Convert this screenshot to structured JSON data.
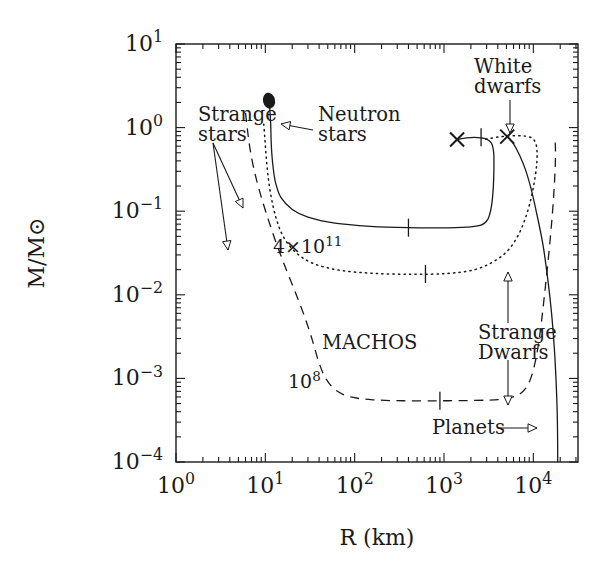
{
  "figure": {
    "type": "scientific-plot",
    "background": "#ffffff",
    "ink": "#1a1a1a"
  },
  "chart_data": {
    "type": "line",
    "title": "",
    "xlabel": "R (km)",
    "ylabel": "M/M⊙",
    "xscale": "log",
    "yscale": "log",
    "xlim": [
      1,
      31623
    ],
    "ylim": [
      0.0001,
      10
    ],
    "grid": false,
    "legend_position": "inline-annotations",
    "x_ticklabels": [
      "10⁰",
      "10¹",
      "10²",
      "10³",
      "10⁴"
    ],
    "x_tick_exponents": [
      0,
      1,
      2,
      3,
      4
    ],
    "y_ticklabels": [
      "10¹",
      "10⁰",
      "10⁻¹",
      "10⁻²",
      "10⁻³",
      "10⁻⁴"
    ],
    "y_tick_exponents": [
      1,
      0,
      -1,
      -2,
      -3,
      -4
    ],
    "series": [
      {
        "name": "neutron-stars-white-dwarfs",
        "style": "solid",
        "description": "Neutron star branch rising to maximum mass then white dwarf / planet sequence",
        "points": [
          [
            11.0,
            2.1
          ],
          [
            11.3,
            1.5
          ],
          [
            11.5,
            1.05
          ],
          [
            11.6,
            0.72
          ],
          [
            11.8,
            0.5
          ],
          [
            12.2,
            0.34
          ],
          [
            13.0,
            0.22
          ],
          [
            15.0,
            0.145
          ],
          [
            20.0,
            0.105
          ],
          [
            30.0,
            0.085
          ],
          [
            60.0,
            0.072
          ],
          [
            150.0,
            0.066
          ],
          [
            400.0,
            0.0635
          ],
          [
            900.0,
            0.0632
          ],
          [
            1800.0,
            0.0645
          ],
          [
            2600.0,
            0.068
          ],
          [
            3100.0,
            0.08
          ],
          [
            3400.0,
            0.115
          ],
          [
            3560.0,
            0.19
          ],
          [
            3620.0,
            0.32
          ],
          [
            3600.0,
            0.5
          ],
          [
            3400.0,
            0.65
          ],
          [
            3000.0,
            0.73
          ],
          [
            2400.0,
            0.76
          ],
          [
            1800.0,
            0.755
          ],
          [
            1400.0,
            0.72
          ]
        ]
      },
      {
        "name": "white-dwarf-outer-sequence",
        "style": "solid",
        "description": "Outer white dwarf branch from maximum-mass cross down to planetary radii",
        "points": [
          [
            5100.0,
            0.78
          ],
          [
            6000.0,
            0.64
          ],
          [
            7000.0,
            0.47
          ],
          [
            8200.0,
            0.31
          ],
          [
            9500.0,
            0.18
          ],
          [
            11000.0,
            0.09
          ],
          [
            12800.0,
            0.04
          ],
          [
            14500.0,
            0.0155
          ],
          [
            16000.0,
            0.006
          ],
          [
            17200.0,
            0.00225
          ],
          [
            18000.0,
            0.0009
          ],
          [
            18500.0,
            0.0004
          ],
          [
            18700.0,
            0.00018
          ],
          [
            18750.0,
            0.0001
          ]
        ]
      },
      {
        "name": "strange-dwarfs-4e11",
        "style": "dotted",
        "label": "4×10¹¹",
        "description": "Strange dwarf sequence with crust base density 4×10¹¹ g/cm³",
        "points": [
          [
            9.6,
            1.1
          ],
          [
            9.9,
            0.72
          ],
          [
            10.2,
            0.46
          ],
          [
            10.7,
            0.27
          ],
          [
            11.6,
            0.15
          ],
          [
            13.2,
            0.083
          ],
          [
            16.0,
            0.049
          ],
          [
            22.0,
            0.032
          ],
          [
            35.0,
            0.0235
          ],
          [
            70.0,
            0.0196
          ],
          [
            170.0,
            0.018
          ],
          [
            450.0,
            0.0176
          ],
          [
            1100.0,
            0.018
          ],
          [
            2200.0,
            0.02
          ],
          [
            3600.0,
            0.025
          ],
          [
            5200.0,
            0.034
          ],
          [
            6800.0,
            0.052
          ],
          [
            8200.0,
            0.084
          ],
          [
            9400.0,
            0.14
          ],
          [
            10300.0,
            0.23
          ],
          [
            10900.0,
            0.36
          ],
          [
            11000.0,
            0.52
          ],
          [
            10600.0,
            0.66
          ],
          [
            9600.0,
            0.75
          ],
          [
            8200.0,
            0.79
          ],
          [
            6600.0,
            0.8
          ],
          [
            5100.0,
            0.79
          ],
          [
            4000.0,
            0.77
          ],
          [
            3200.0,
            0.74
          ],
          [
            2700.0,
            0.71
          ]
        ]
      },
      {
        "name": "strange-dwarfs-1e8",
        "style": "dashed",
        "label": "10⁸",
        "description": "Strange dwarf sequence with crust base density 10⁸ g/cm³",
        "points": [
          [
            6.0,
            1.5
          ],
          [
            6.3,
            0.95
          ],
          [
            6.7,
            0.58
          ],
          [
            7.4,
            0.33
          ],
          [
            8.6,
            0.175
          ],
          [
            10.4,
            0.09
          ],
          [
            13.0,
            0.044
          ],
          [
            17.0,
            0.0205
          ],
          [
            22.0,
            0.0103
          ],
          [
            28.0,
            0.0052
          ],
          [
            34.0,
            0.00275
          ],
          [
            40.0,
            0.00152
          ],
          [
            48.0,
            0.00098
          ],
          [
            62.0,
            0.00072
          ],
          [
            90.0,
            0.0006
          ],
          [
            160.0,
            0.000555
          ],
          [
            350.0,
            0.00054
          ],
          [
            900.0,
            0.00054
          ],
          [
            2200.0,
            0.000545
          ],
          [
            4200.0,
            0.00056
          ],
          [
            6500.0,
            0.00062
          ],
          [
            8200.0,
            0.00076
          ],
          [
            9500.0,
            0.00105
          ],
          [
            10600.0,
            0.00165
          ],
          [
            11600.0,
            0.0029
          ],
          [
            12500.0,
            0.0054
          ],
          [
            13400.0,
            0.0105
          ],
          [
            14400.0,
            0.0215
          ],
          [
            15400.0,
            0.045
          ],
          [
            16300.0,
            0.09
          ],
          [
            17000.0,
            0.17
          ],
          [
            17500.0,
            0.3
          ],
          [
            17700.0,
            0.47
          ],
          [
            17600.0,
            0.64
          ],
          [
            17200.0,
            0.76
          ]
        ]
      }
    ],
    "markers": [
      {
        "name": "neutron-star-maximum-mass",
        "glyph": "filled-circle",
        "x": 11.0,
        "y": 2.1
      },
      {
        "name": "cross-marker-left",
        "glyph": "cross",
        "x": 1400.0,
        "y": 0.72
      },
      {
        "name": "cross-marker-right",
        "glyph": "cross",
        "x": 5100.0,
        "y": 0.78
      },
      {
        "name": "tick-on-solid-upper",
        "glyph": "tick",
        "x": 2600.0,
        "y": 0.765
      },
      {
        "name": "tick-on-solid-lower",
        "glyph": "tick",
        "x": 400.0,
        "y": 0.0635
      },
      {
        "name": "tick-on-dotted",
        "glyph": "tick",
        "x": 620.0,
        "y": 0.0177
      },
      {
        "name": "tick-on-dashed",
        "glyph": "tick",
        "x": 900.0,
        "y": 0.00054
      }
    ],
    "annotations": [
      {
        "name": "strange-stars-label",
        "text_lines": [
          "Strange",
          "stars"
        ],
        "x_px": 198,
        "y_px": 121,
        "align": "left"
      },
      {
        "name": "neutron-stars-label",
        "text_lines": [
          "Neutron",
          "stars"
        ],
        "x_px": 318,
        "y_px": 121,
        "align": "left"
      },
      {
        "name": "white-dwarfs-label",
        "text_lines": [
          "White",
          "dwarfs"
        ],
        "x_px": 474,
        "y_px": 73,
        "align": "left"
      },
      {
        "name": "strange-dwarfs-label",
        "text_lines": [
          "Strange",
          "Dwarfs"
        ],
        "x_px": 478,
        "y_px": 339,
        "align": "left"
      },
      {
        "name": "machos-label",
        "text_lines": [
          "MACHOS"
        ],
        "x_px": 322,
        "y_px": 349,
        "align": "left"
      },
      {
        "name": "planets-label",
        "text_lines": [
          "Planets"
        ],
        "x_px": 432,
        "y_px": 434,
        "align": "left"
      },
      {
        "name": "curve-label-4e11",
        "text_lines": [
          "4×10¹¹"
        ],
        "x_px": 273,
        "y_px": 253,
        "align": "left"
      },
      {
        "name": "curve-label-1e8",
        "text_lines": [
          "10⁸"
        ],
        "x_px": 288,
        "y_px": 388,
        "align": "left"
      }
    ]
  }
}
